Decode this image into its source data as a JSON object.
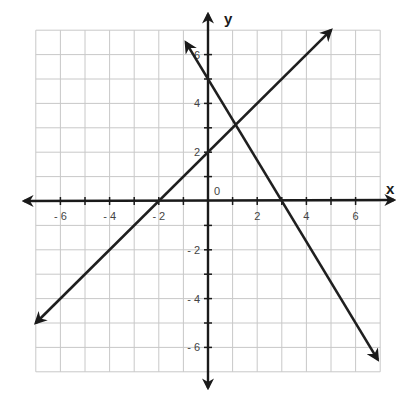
{
  "chart_data": {
    "type": "line",
    "title": "",
    "xlabel": "x",
    "ylabel": "y",
    "origin_label": "0",
    "xlim": [
      -7,
      7
    ],
    "ylim": [
      -7,
      7
    ],
    "grid": true,
    "x_ticks": [
      -6,
      -4,
      -2,
      2,
      4,
      6
    ],
    "y_ticks": [
      -6,
      -4,
      -2,
      2,
      4,
      6
    ],
    "x_tick_labels": [
      "- 6",
      "- 4",
      "- 2",
      "2",
      "4",
      "6"
    ],
    "y_tick_labels": [
      "- 6",
      "- 4",
      "- 2",
      "2",
      "4",
      "6"
    ],
    "series": [
      {
        "name": "line-1",
        "equation": "y = x + 2",
        "x": [
          -7,
          5
        ],
        "y": [
          -5,
          7
        ],
        "intercepts": {
          "x": -2,
          "y": 2
        }
      },
      {
        "name": "line-2",
        "equation": "y = -5/3 x + 5",
        "x": [
          -0.9,
          6.9
        ],
        "y": [
          6.5,
          -6.5
        ],
        "intercepts": {
          "x": 3,
          "y": 5
        }
      }
    ],
    "intersection": {
      "x": 1.125,
      "y": 3.125
    }
  },
  "colors": {
    "line": "#1f1f1f",
    "grid": "#c8c8c8",
    "background": "#ffffff"
  }
}
